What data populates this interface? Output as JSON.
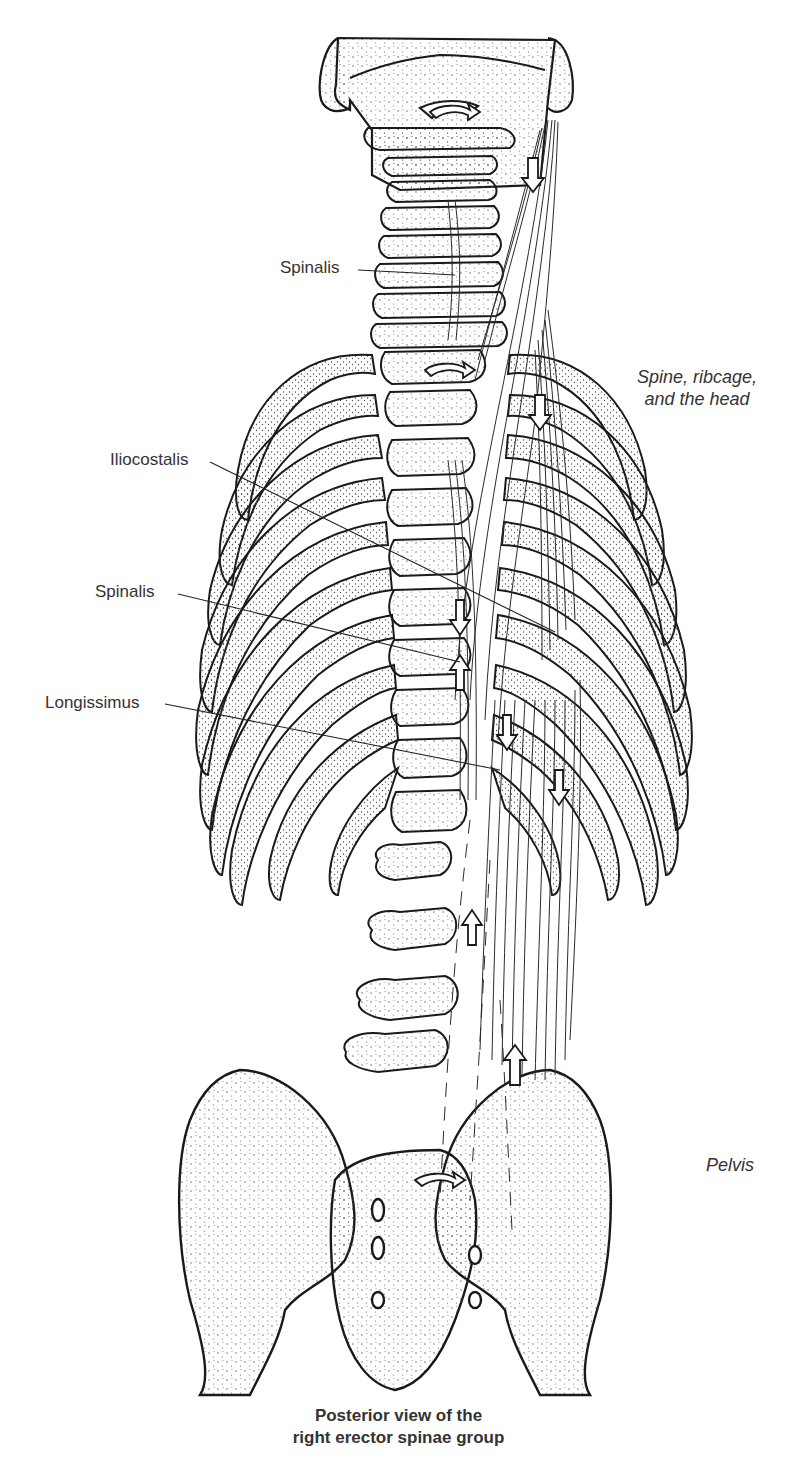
{
  "figure": {
    "title": "Posterior view of the right erector spinae group",
    "regions": {
      "upper": [
        "Spine, ribcage,",
        "and the head"
      ],
      "lower": "Pelvis"
    },
    "labels": [
      {
        "text": "Spinalis",
        "x": 280,
        "y": 258
      },
      {
        "text": "Iliocostalis",
        "x": 110,
        "y": 450
      },
      {
        "text": "Spinalis",
        "x": 95,
        "y": 582
      },
      {
        "text": "Longissimus",
        "x": 45,
        "y": 693
      }
    ],
    "caption": [
      "Posterior view of the",
      "right erector spinae group"
    ],
    "colors": {
      "line": "#1a1a1a",
      "stipple": "#6a6a6a",
      "background": "#ffffff"
    }
  }
}
